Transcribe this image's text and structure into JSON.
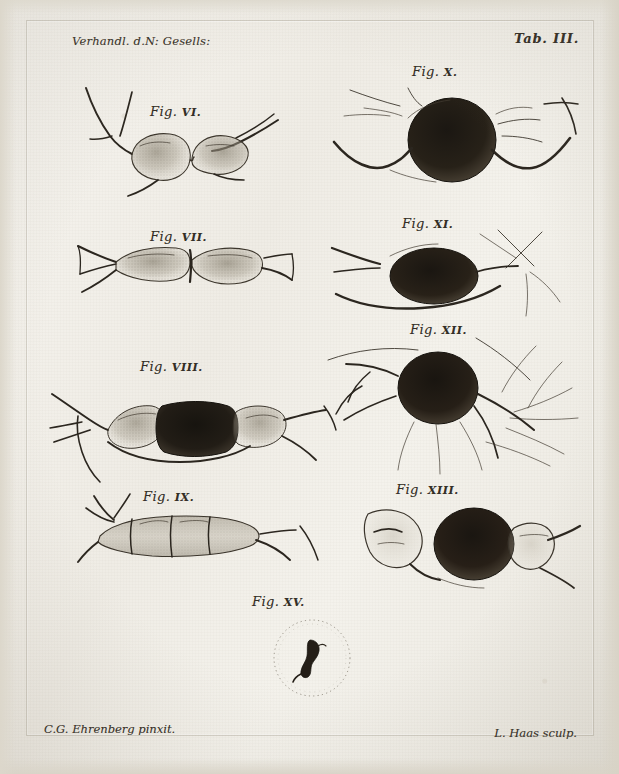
{
  "plate": {
    "header_left": "Verhandl. d.N: Gesells:",
    "header_right": "Tab. III.",
    "credit_artist": "C.G. Ehrenberg pinxit.",
    "credit_engraver": "L. Haas sculp.",
    "paper_color": "#f3f1ec",
    "ink_color": "#2b261f"
  },
  "figures": [
    {
      "id": "fig-6",
      "label": "Fig.",
      "numeral": "VI.",
      "caption_x": 150,
      "caption_y": 104
    },
    {
      "id": "fig-7",
      "label": "Fig.",
      "numeral": "VII.",
      "caption_x": 150,
      "caption_y": 229
    },
    {
      "id": "fig-8",
      "label": "Fig.",
      "numeral": "VIII.",
      "caption_x": 140,
      "caption_y": 359
    },
    {
      "id": "fig-9",
      "label": "Fig.",
      "numeral": "IX.",
      "caption_x": 143,
      "caption_y": 489
    },
    {
      "id": "fig-10",
      "label": "Fig.",
      "numeral": "X.",
      "caption_x": 412,
      "caption_y": 64
    },
    {
      "id": "fig-11",
      "label": "Fig.",
      "numeral": "XI.",
      "caption_x": 402,
      "caption_y": 216
    },
    {
      "id": "fig-12",
      "label": "Fig.",
      "numeral": "XII.",
      "caption_x": 410,
      "caption_y": 322
    },
    {
      "id": "fig-13",
      "label": "Fig.",
      "numeral": "XIII.",
      "caption_x": 396,
      "caption_y": 482
    },
    {
      "id": "fig-15",
      "label": "Fig.",
      "numeral": "XV.",
      "caption_x": 252,
      "caption_y": 594
    }
  ]
}
